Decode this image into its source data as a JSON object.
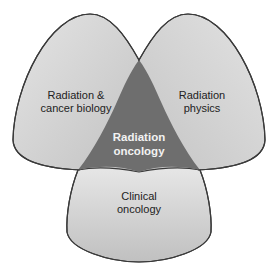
{
  "diagram": {
    "type": "venn",
    "sets": [
      {
        "id": "left",
        "label_line1": "Radiation &",
        "label_line2": "cancer biology"
      },
      {
        "id": "right",
        "label_line1": "Radiation",
        "label_line2": "physics"
      },
      {
        "id": "bottom",
        "label_line1": "Clinical",
        "label_line2": "oncology"
      }
    ],
    "intersection": {
      "label_line1": "Radiation",
      "label_line2": "oncology"
    },
    "colors": {
      "lobe_light": "#dcdcdc",
      "lobe_mid": "#c4c4c4",
      "intersection": "#6e6e6e",
      "outline": "#3a3a3a",
      "center_text": "#f2f2f2",
      "label_text": "#222222"
    }
  }
}
